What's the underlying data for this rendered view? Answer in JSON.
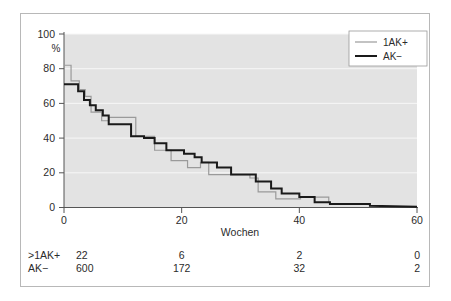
{
  "chart_data": {
    "type": "line",
    "title": "",
    "subtitle": "",
    "xlabel": "Wochen",
    "ylabel": "%",
    "xlim": [
      0,
      60
    ],
    "ylim": [
      0,
      100
    ],
    "xticks": [
      0,
      20,
      40,
      60
    ],
    "xticklabels": [
      "0",
      "20",
      "40",
      "60"
    ],
    "yticks": [
      0,
      20,
      40,
      60,
      80,
      100
    ],
    "yticklabels": [
      "0",
      "20",
      "40",
      "60",
      "80",
      "100"
    ],
    "grid": "horizontal",
    "legend_position": "top-right",
    "plot_background": "#e3e3e3",
    "gridline_color": "#f5f5f5",
    "series": [
      {
        "name": "1AK+",
        "color": "#9a9a9a",
        "linewidth": 1.2,
        "style": "step",
        "points": [
          [
            0,
            82
          ],
          [
            1.2,
            82
          ],
          [
            1.2,
            73
          ],
          [
            2.6,
            73
          ],
          [
            2.6,
            68
          ],
          [
            3.6,
            68
          ],
          [
            3.6,
            64
          ],
          [
            4.6,
            64
          ],
          [
            4.6,
            55
          ],
          [
            6.4,
            55
          ],
          [
            6.4,
            50
          ],
          [
            7.6,
            50
          ],
          [
            7.6,
            52
          ],
          [
            12.2,
            52
          ],
          [
            12.2,
            41
          ],
          [
            15.4,
            41
          ],
          [
            15.4,
            33
          ],
          [
            18.2,
            33
          ],
          [
            18.2,
            27
          ],
          [
            21.0,
            27
          ],
          [
            21.0,
            23
          ],
          [
            23.2,
            23
          ],
          [
            23.2,
            26
          ],
          [
            24.6,
            26
          ],
          [
            24.6,
            19
          ],
          [
            31.6,
            19
          ],
          [
            31.6,
            17
          ],
          [
            33.0,
            17
          ],
          [
            33.0,
            9
          ],
          [
            36.0,
            9
          ],
          [
            36.0,
            5
          ],
          [
            40.2,
            5
          ],
          [
            40.2,
            6
          ],
          [
            45.0,
            6
          ],
          [
            45.0,
            3
          ]
        ]
      },
      {
        "name": "AK−",
        "color": "#1a1a1a",
        "linewidth": 2.0,
        "style": "step",
        "points": [
          [
            0,
            71
          ],
          [
            2.4,
            71
          ],
          [
            2.4,
            67
          ],
          [
            3.4,
            67
          ],
          [
            3.4,
            62
          ],
          [
            4.4,
            62
          ],
          [
            4.4,
            59
          ],
          [
            5.4,
            59
          ],
          [
            5.4,
            56
          ],
          [
            6.6,
            56
          ],
          [
            6.6,
            53
          ],
          [
            7.6,
            53
          ],
          [
            7.6,
            48
          ],
          [
            11.4,
            48
          ],
          [
            11.4,
            41
          ],
          [
            13.6,
            41
          ],
          [
            13.6,
            40
          ],
          [
            15.4,
            40
          ],
          [
            15.4,
            37
          ],
          [
            17.4,
            37
          ],
          [
            17.4,
            33
          ],
          [
            20.4,
            33
          ],
          [
            20.4,
            31
          ],
          [
            22.2,
            31
          ],
          [
            22.2,
            29
          ],
          [
            23.4,
            29
          ],
          [
            23.4,
            26
          ],
          [
            26.0,
            26
          ],
          [
            26.0,
            23
          ],
          [
            28.4,
            23
          ],
          [
            28.4,
            19
          ],
          [
            32.6,
            19
          ],
          [
            32.6,
            15
          ],
          [
            35.2,
            15
          ],
          [
            35.2,
            11
          ],
          [
            37.0,
            11
          ],
          [
            37.0,
            8
          ],
          [
            40.0,
            8
          ],
          [
            40.0,
            6
          ],
          [
            42.6,
            6
          ],
          [
            42.6,
            3
          ],
          [
            45.2,
            3
          ],
          [
            45.2,
            2
          ],
          [
            52.0,
            2
          ],
          [
            52.0,
            1
          ],
          [
            60,
            0.5
          ]
        ]
      }
    ],
    "risk_table": {
      "columns_x": [
        0,
        20,
        40,
        60
      ],
      "rows": [
        {
          "label": ">1AK+",
          "values": [
            "22",
            "6",
            "2",
            "0"
          ]
        },
        {
          "label": "AK−",
          "values": [
            "600",
            "172",
            "32",
            "2"
          ]
        }
      ]
    },
    "legend": [
      {
        "label": "1AK+",
        "color": "#9a9a9a",
        "linewidth": 1.2
      },
      {
        "label": "AK−",
        "color": "#1a1a1a",
        "linewidth": 2.0
      }
    ]
  }
}
